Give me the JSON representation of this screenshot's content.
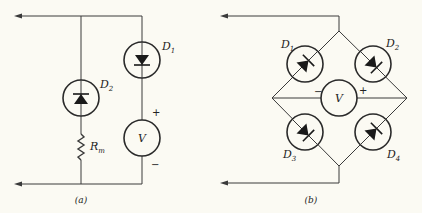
{
  "figure": {
    "panels": [
      {
        "id": "a",
        "caption": "(a)",
        "components": {
          "d1": {
            "name": "D",
            "sub": "1"
          },
          "d2": {
            "name": "D",
            "sub": "2"
          },
          "rm": {
            "name": "R",
            "sub": "m"
          },
          "voltmeter": {
            "label": "V",
            "plus": "+",
            "minus": "−"
          }
        }
      },
      {
        "id": "b",
        "caption": "(b)",
        "components": {
          "d1": {
            "name": "D",
            "sub": "1"
          },
          "d2": {
            "name": "D",
            "sub": "2"
          },
          "d3": {
            "name": "D",
            "sub": "3"
          },
          "d4": {
            "name": "D",
            "sub": "4"
          },
          "voltmeter": {
            "label": "V",
            "plus": "+",
            "minus": "−"
          }
        }
      }
    ],
    "colors": {
      "line": "#3a3a3a",
      "background": "#fbfaf3"
    }
  }
}
